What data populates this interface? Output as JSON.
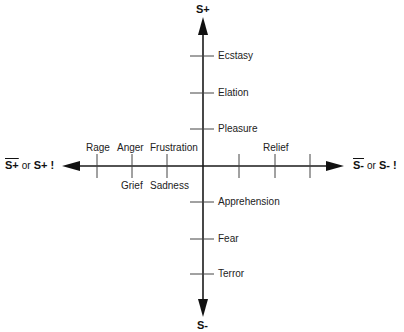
{
  "diagram": {
    "axes": {
      "top": "S+",
      "bottom": "S-",
      "left": {
        "overlined": "S+",
        "connector": "or",
        "exclaimed": "S+ !"
      },
      "right": {
        "overlined": "S-",
        "connector": "or",
        "exclaimed": "S- !"
      }
    },
    "vertical_positive": [
      "Ecstasy",
      "Elation",
      "Pleasure"
    ],
    "vertical_negative": [
      "Apprehension",
      "Fear",
      "Terror"
    ],
    "horizontal_left_above": [
      "Rage",
      "Anger",
      "Frustration"
    ],
    "horizontal_left_below": [
      "Grief",
      "Sadness"
    ],
    "horizontal_right_above": [
      "Relief"
    ],
    "colors": {
      "line": "#1a1a1a",
      "tick": "#444444"
    }
  }
}
